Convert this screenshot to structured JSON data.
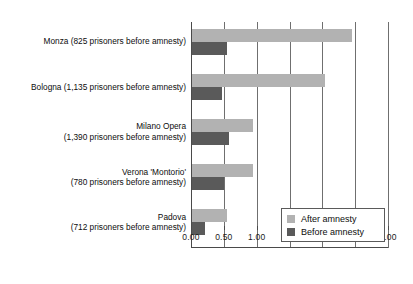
{
  "chart_data": {
    "type": "bar",
    "orientation": "horizontal",
    "title": "",
    "subtitle": "",
    "xlabel": "",
    "ylabel": "",
    "xlim": [
      0.0,
      3.0
    ],
    "xticks": [
      "0.00",
      "0.50",
      "1.00",
      "1.50",
      "2.00",
      "2.50",
      "3.00"
    ],
    "xtick_values": [
      0.0,
      0.5,
      1.0,
      1.5,
      2.0,
      2.5,
      3.0
    ],
    "grid": true,
    "legend_position": "bottom-right",
    "categories": [
      "Monza (825 prisoners before amnesty)",
      "Bologna (1,135 prisoners before amnesty)",
      "Milano Opera (1,390 prisoners before amnesty)",
      "Verona 'Montorio' (780 prisoners before amnesty)",
      "Padova (712 prisoners before amnesty)"
    ],
    "category_lines": [
      [
        "Monza (825 prisoners before amnesty)"
      ],
      [
        "Bologna (1,135 prisoners before amnesty)"
      ],
      [
        "Milano Opera",
        "(1,390 prisoners before amnesty)"
      ],
      [
        "Verona 'Montorio'",
        "(780 prisoners before amnesty)"
      ],
      [
        "Padova",
        "(712 prisoners before amnesty)"
      ]
    ],
    "series": [
      {
        "name": "After amnesty",
        "color": "#b2b2b2",
        "values": [
          2.44,
          2.03,
          0.93,
          0.93,
          0.53
        ]
      },
      {
        "name": "Before amnesty",
        "color": "#5a5a5a",
        "values": [
          0.53,
          0.45,
          0.56,
          0.48,
          0.2
        ]
      }
    ]
  },
  "legend": {
    "items": [
      {
        "label": "After amnesty",
        "color": "#b2b2b2"
      },
      {
        "label": "Before amnesty",
        "color": "#5a5a5a"
      }
    ]
  },
  "axis": {
    "tick_labels": [
      "0.00",
      "0.50",
      "1.00",
      "1.50",
      "2.00",
      "2.50",
      "3.00"
    ]
  }
}
